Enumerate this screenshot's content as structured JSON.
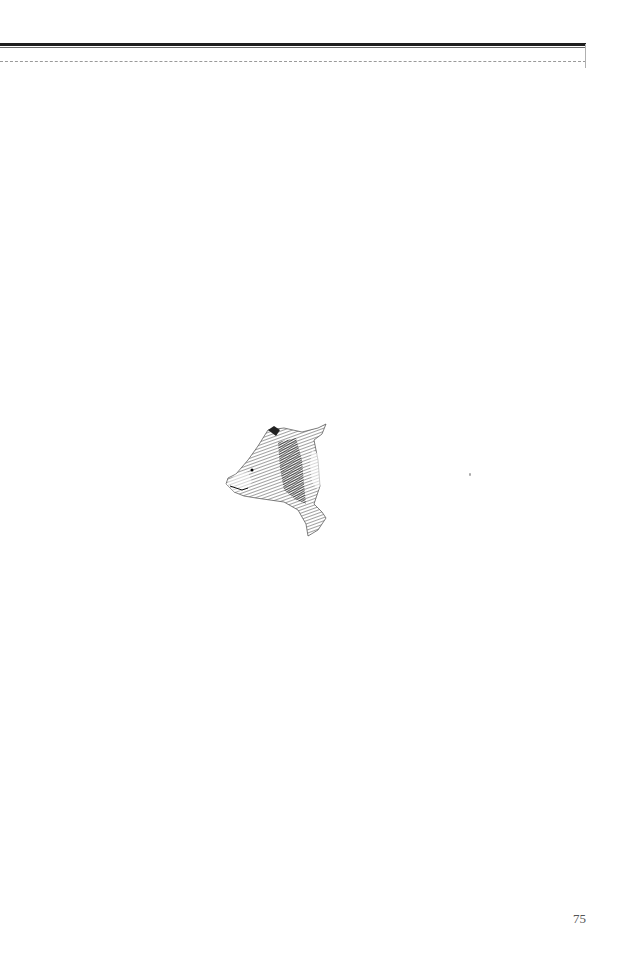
{
  "page": {
    "page_number": "75",
    "illustration": {
      "subject": "bear-head-sketch",
      "description": "Pen-and-ink hatched sketch of a bear's head and neck in profile, facing left"
    },
    "header_rule": {
      "color_thick": "#1e1e1e",
      "color_dashed": "#9a9a9a"
    }
  }
}
